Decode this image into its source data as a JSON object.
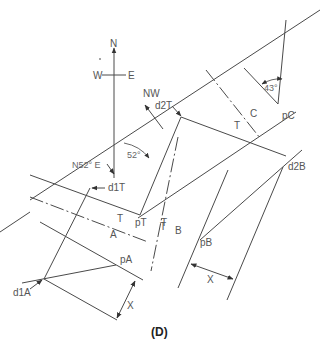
{
  "figure": {
    "panel_label": "(D)",
    "compass": {
      "north": "N",
      "west": "W",
      "east": "E"
    },
    "directions": {
      "northwest": "NW",
      "strike": "N52° E"
    },
    "angles": {
      "strike_angle": "52°",
      "dip_angle": "43°"
    },
    "points": {
      "d1T": "d1T",
      "d2T": "d2T",
      "d1A": "d1A",
      "d2B": "d2B",
      "pT": "pT",
      "pA": "pA",
      "pB": "pB",
      "pC": "pC"
    },
    "units": {
      "T_A": "T",
      "A": "A",
      "T_B": "T",
      "B": "B",
      "T_C": "T",
      "C": "C",
      "T_pt": "T"
    },
    "dimensions": {
      "x_left": "X",
      "x_right": "X"
    }
  }
}
